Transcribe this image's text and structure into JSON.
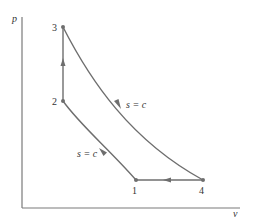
{
  "diagram": {
    "type": "p-v diagram (Otto cycle)",
    "axes": {
      "y_label": "p",
      "x_label": "v"
    },
    "states": [
      {
        "id": "1",
        "label": "1",
        "x": 136,
        "y": 180
      },
      {
        "id": "2",
        "label": "2",
        "x": 63,
        "y": 101
      },
      {
        "id": "3",
        "label": "3",
        "x": 63,
        "y": 27
      },
      {
        "id": "4",
        "label": "4",
        "x": 203,
        "y": 180
      }
    ],
    "processes": [
      {
        "from": "1",
        "to": "2",
        "kind": "isentropic compression",
        "label": "s = c"
      },
      {
        "from": "2",
        "to": "3",
        "kind": "constant volume heat addition",
        "label": ""
      },
      {
        "from": "3",
        "to": "4",
        "kind": "isentropic expansion",
        "label": "s = c"
      },
      {
        "from": "4",
        "to": "1",
        "kind": "constant volume heat rejection",
        "label": ""
      }
    ],
    "colors": {
      "curve": "#6e6e6e",
      "axis": "#7a7a7a",
      "text": "#333333"
    }
  }
}
